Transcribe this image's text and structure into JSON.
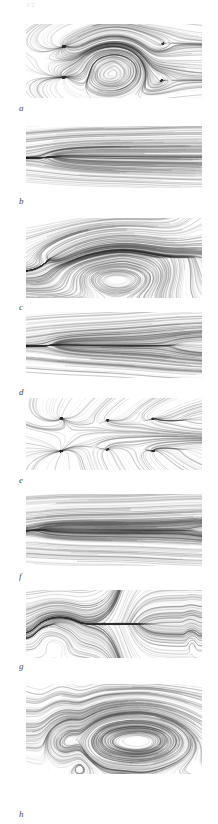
{
  "figure": {
    "background_color": "#ffffff",
    "ink_color": "#303030",
    "corner_mark": "F2",
    "width": 218,
    "height": 824,
    "panel_count": 8
  },
  "panels": [
    {
      "label": "a",
      "label_x": 19,
      "label_y": 104,
      "x": 26,
      "y": 24,
      "w": 176,
      "h": 74,
      "type": "streamline-field",
      "description": "symmetric pair of spiral saddle nodes at left with arc separatrices, central lobed cell, two outer saddle points at right",
      "features": [
        {
          "kind": "focus",
          "cx": 0.22,
          "cy": 0.3,
          "strength": 0.95
        },
        {
          "kind": "focus",
          "cx": 0.22,
          "cy": 0.72,
          "strength": 0.95
        },
        {
          "kind": "cell",
          "cx": 0.5,
          "cy": 0.5,
          "rx": 0.16,
          "ry": 0.44
        },
        {
          "kind": "saddle",
          "cx": 0.83,
          "cy": 0.26,
          "strength": 0.7
        },
        {
          "kind": "saddle",
          "cx": 0.83,
          "cy": 0.76,
          "strength": 0.7
        }
      ],
      "density": 0.72
    },
    {
      "label": "b",
      "label_x": 19,
      "label_y": 197,
      "x": 26,
      "y": 126,
      "w": 176,
      "h": 62,
      "type": "streamline-field",
      "description": "nearly horizontal parallel streamlines across full width with a single sharp convergence node at left quarter",
      "features": [
        {
          "kind": "focus",
          "cx": 0.16,
          "cy": 0.5,
          "strength": 0.85
        },
        {
          "kind": "parallel",
          "cx": 0.6,
          "cy": 0.5,
          "strength": 0.3
        }
      ],
      "density": 0.55
    },
    {
      "label": "c",
      "label_x": 19,
      "label_y": 303,
      "x": 26,
      "y": 218,
      "w": 176,
      "h": 80,
      "type": "streamline-field",
      "description": "large rounded-rectangle recirculation envelope, dense radial burst at left apex, vertical banding at right end",
      "features": [
        {
          "kind": "focus",
          "cx": 0.14,
          "cy": 0.5,
          "strength": 1.0
        },
        {
          "kind": "cell",
          "cx": 0.55,
          "cy": 0.5,
          "rx": 0.38,
          "ry": 0.42
        },
        {
          "kind": "band",
          "cx": 0.9,
          "cy": 0.5,
          "strength": 0.6
        }
      ],
      "density": 0.92
    },
    {
      "label": "d",
      "label_x": 19,
      "label_y": 388,
      "x": 26,
      "y": 312,
      "w": 176,
      "h": 66,
      "type": "streamline-field",
      "description": "two radial star nodes, one at left quarter and one at right quarter, joined by near-horizontal bundle",
      "features": [
        {
          "kind": "focus",
          "cx": 0.18,
          "cy": 0.5,
          "strength": 0.95
        },
        {
          "kind": "focus",
          "cx": 0.86,
          "cy": 0.5,
          "strength": 0.9
        },
        {
          "kind": "parallel",
          "cx": 0.5,
          "cy": 0.5,
          "strength": 0.45
        }
      ],
      "density": 0.62
    },
    {
      "label": "e",
      "label_x": 19,
      "label_y": 476,
      "x": 26,
      "y": 398,
      "w": 176,
      "h": 72,
      "type": "streamline-field",
      "description": "six scattered star-shaped critical points arranged in two rows, sparse connecting field",
      "features": [
        {
          "kind": "focus",
          "cx": 0.2,
          "cy": 0.28,
          "strength": 0.8
        },
        {
          "kind": "focus",
          "cx": 0.2,
          "cy": 0.74,
          "strength": 0.8
        },
        {
          "kind": "focus",
          "cx": 0.47,
          "cy": 0.3,
          "strength": 0.5
        },
        {
          "kind": "focus",
          "cx": 0.47,
          "cy": 0.72,
          "strength": 0.5
        },
        {
          "kind": "focus",
          "cx": 0.73,
          "cy": 0.28,
          "strength": 0.75
        },
        {
          "kind": "focus",
          "cx": 0.73,
          "cy": 0.74,
          "strength": 0.75
        },
        {
          "kind": "focus",
          "cx": 0.92,
          "cy": 0.3,
          "strength": 0.6
        },
        {
          "kind": "focus",
          "cx": 0.92,
          "cy": 0.72,
          "strength": 0.6
        }
      ],
      "density": 0.6
    },
    {
      "label": "f",
      "label_x": 19,
      "label_y": 572,
      "x": 26,
      "y": 494,
      "w": 176,
      "h": 72,
      "type": "streamline-field",
      "description": "dense fan convergence at left edge spreading into long horizontal bundle that re-converges at right edge",
      "features": [
        {
          "kind": "focus",
          "cx": 0.1,
          "cy": 0.5,
          "strength": 1.0
        },
        {
          "kind": "parallel",
          "cx": 0.55,
          "cy": 0.5,
          "strength": 0.75
        },
        {
          "kind": "focus",
          "cx": 0.96,
          "cy": 0.5,
          "strength": 0.7
        }
      ],
      "density": 0.85
    },
    {
      "label": "g",
      "label_x": 19,
      "label_y": 662,
      "x": 26,
      "y": 590,
      "w": 176,
      "h": 68,
      "type": "streamline-field",
      "description": "closed lobed pocket at left with small centre node, strong vertical dense band mid-field, narrow vertical closed loop at right edge",
      "features": [
        {
          "kind": "cell",
          "cx": 0.17,
          "cy": 0.5,
          "rx": 0.12,
          "ry": 0.45
        },
        {
          "kind": "focus",
          "cx": 0.17,
          "cy": 0.5,
          "strength": 0.5
        },
        {
          "kind": "band",
          "cx": 0.55,
          "cy": 0.5,
          "strength": 1.0
        },
        {
          "kind": "cell",
          "cx": 0.94,
          "cy": 0.5,
          "rx": 0.035,
          "ry": 0.42
        }
      ],
      "density": 0.88
    },
    {
      "label": "h",
      "label_x": 19,
      "label_y": 810,
      "x": 26,
      "y": 684,
      "w": 176,
      "h": 90,
      "type": "streamline-field",
      "description": "nested hairpin loops: stacked closed contours at left forming a figure-eight, long U-shaped bands extending to the right",
      "features": [
        {
          "kind": "loopstack",
          "cx": 0.2,
          "cy": 0.5,
          "rx": 0.1,
          "ry": 0.4
        },
        {
          "kind": "hairpin",
          "cx": 0.62,
          "cy": 0.5,
          "rx": 0.36,
          "ry": 0.34
        }
      ],
      "density": 0.8
    }
  ]
}
